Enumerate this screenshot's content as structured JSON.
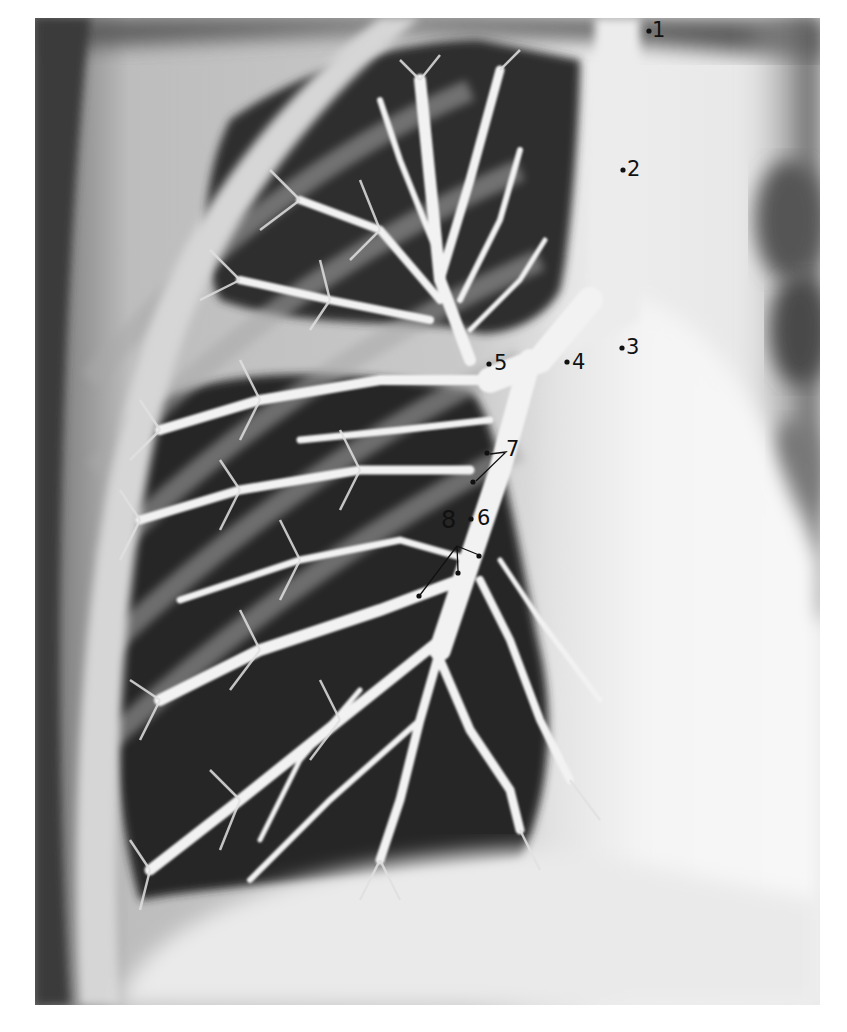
{
  "figure": {
    "labels": [
      {
        "text": "1",
        "dot": [
          649,
          31
        ],
        "text_pos": [
          653,
          19
        ]
      },
      {
        "text": "2",
        "dot": [
          623,
          170
        ],
        "text_pos": [
          627,
          158
        ]
      },
      {
        "text": "3",
        "dot": [
          622,
          348
        ],
        "text_pos": [
          626,
          337
        ]
      },
      {
        "text": "4",
        "dot": [
          567,
          362
        ],
        "text_pos": [
          572,
          352
        ]
      },
      {
        "text": "5",
        "dot": [
          489,
          364
        ],
        "text_pos": [
          494,
          353
        ]
      },
      {
        "text": "6",
        "dot": [
          471,
          519
        ],
        "text_pos": [
          477,
          507
        ]
      },
      {
        "text": "7",
        "dots": [
          [
            487,
            453
          ],
          [
            473,
            482
          ]
        ],
        "text_pos": [
          506,
          439
        ]
      },
      {
        "text": "8",
        "dots": [
          [
            479,
            556
          ],
          [
            458,
            573
          ],
          [
            419,
            596
          ]
        ],
        "text_pos": [
          441,
          508
        ]
      }
    ]
  }
}
